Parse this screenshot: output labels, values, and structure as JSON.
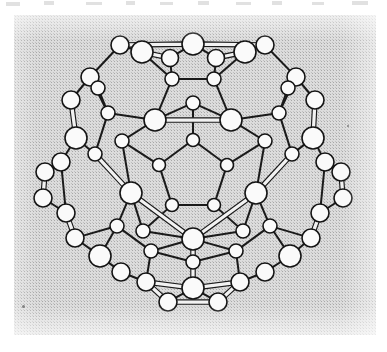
{
  "figure": {
    "caption": "",
    "alt_text": "Ball-and-stick structural model of the C60 buckminsterfullerene molecule viewed down a pseudo five-fold axis, drawn as open circles joined by double-line bonds on a grey halftone scanned background.",
    "rendering_style": "scanned halftone line drawing"
  },
  "colors": {
    "page_background": "#ffffff",
    "scan_background": "#dcdcdc",
    "halftone_dot": "#6e6e6e",
    "bond_stroke": "#1a1a1a",
    "bond_fill": "#f2f2f2",
    "atom_stroke": "#141414",
    "atom_fill": "#fafafa",
    "dust_speck": "#6a6a6a"
  },
  "scan_panel": {
    "x": 14,
    "y": 15,
    "width": 362,
    "height": 320
  },
  "scan_marks": [
    {
      "x": 6,
      "y": 2,
      "width": 14,
      "height": 4
    },
    {
      "x": 44,
      "y": 1,
      "width": 10,
      "height": 4
    },
    {
      "x": 86,
      "y": 2,
      "width": 16,
      "height": 3
    },
    {
      "x": 126,
      "y": 1,
      "width": 9,
      "height": 4
    },
    {
      "x": 160,
      "y": 2,
      "width": 13,
      "height": 3
    },
    {
      "x": 198,
      "y": 1,
      "width": 11,
      "height": 4
    },
    {
      "x": 236,
      "y": 2,
      "width": 15,
      "height": 3
    },
    {
      "x": 272,
      "y": 1,
      "width": 10,
      "height": 4
    },
    {
      "x": 312,
      "y": 2,
      "width": 12,
      "height": 3
    },
    {
      "x": 352,
      "y": 1,
      "width": 16,
      "height": 4
    }
  ],
  "dust_specks": [
    {
      "x": 22,
      "y": 305,
      "size": 3
    },
    {
      "x": 347,
      "y": 125,
      "size": 2
    }
  ],
  "molecule_data": {
    "type": "ball-and-stick",
    "formula": "C60",
    "name": "Buckminsterfullerene",
    "symmetry": "Ih",
    "atom_count": 60,
    "bond_count": 90,
    "face_counts": {
      "pentagons": 12,
      "hexagons": 20
    },
    "viewpoint": "down a pseudo five-fold axis",
    "atom_radii": {
      "front": 11,
      "middle": 8.5,
      "mid_back": 6.5,
      "back": 9
    },
    "atoms": [
      {
        "id": 0,
        "x": 193,
        "y": 140,
        "r": 6.5,
        "layer": "front-inner"
      },
      {
        "id": 1,
        "x": 159,
        "y": 165,
        "r": 6.5,
        "layer": "front-inner"
      },
      {
        "id": 2,
        "x": 172,
        "y": 205,
        "r": 6.5,
        "layer": "front-inner"
      },
      {
        "id": 3,
        "x": 214,
        "y": 205,
        "r": 6.5,
        "layer": "front-inner"
      },
      {
        "id": 4,
        "x": 227,
        "y": 165,
        "r": 6.5,
        "layer": "front-inner"
      },
      {
        "id": 5,
        "x": 193,
        "y": 103,
        "r": 7.0,
        "layer": "front-ring"
      },
      {
        "id": 6,
        "x": 122,
        "y": 141,
        "r": 7.0,
        "layer": "front-ring"
      },
      {
        "id": 7,
        "x": 143,
        "y": 231,
        "r": 7.0,
        "layer": "front-ring"
      },
      {
        "id": 8,
        "x": 243,
        "y": 231,
        "r": 7.0,
        "layer": "front-ring"
      },
      {
        "id": 9,
        "x": 265,
        "y": 141,
        "r": 7.0,
        "layer": "front-ring"
      },
      {
        "id": 10,
        "x": 155,
        "y": 120,
        "r": 11,
        "layer": "front-large"
      },
      {
        "id": 11,
        "x": 231,
        "y": 120,
        "r": 11,
        "layer": "front-large"
      },
      {
        "id": 12,
        "x": 256,
        "y": 193,
        "r": 11,
        "layer": "front-large"
      },
      {
        "id": 13,
        "x": 193,
        "y": 239,
        "r": 11,
        "layer": "front-large"
      },
      {
        "id": 14,
        "x": 131,
        "y": 193,
        "r": 11,
        "layer": "front-large"
      },
      {
        "id": 15,
        "x": 172,
        "y": 79,
        "r": 7.0,
        "layer": "mid-upper"
      },
      {
        "id": 16,
        "x": 214,
        "y": 79,
        "r": 7.0,
        "layer": "mid-upper"
      },
      {
        "id": 17,
        "x": 279,
        "y": 113,
        "r": 7.0,
        "layer": "mid-upper"
      },
      {
        "id": 18,
        "x": 292,
        "y": 154,
        "r": 7.0,
        "layer": "mid-upper"
      },
      {
        "id": 19,
        "x": 270,
        "y": 226,
        "r": 7.0,
        "layer": "mid-lower"
      },
      {
        "id": 20,
        "x": 236,
        "y": 251,
        "r": 7.0,
        "layer": "mid-lower"
      },
      {
        "id": 21,
        "x": 151,
        "y": 251,
        "r": 7.0,
        "layer": "mid-lower"
      },
      {
        "id": 22,
        "x": 117,
        "y": 226,
        "r": 7.0,
        "layer": "mid-lower"
      },
      {
        "id": 23,
        "x": 95,
        "y": 154,
        "r": 7.0,
        "layer": "mid-upper"
      },
      {
        "id": 24,
        "x": 108,
        "y": 113,
        "r": 7.0,
        "layer": "mid-upper"
      },
      {
        "id": 25,
        "x": 142,
        "y": 52,
        "r": 11,
        "layer": "equator-large"
      },
      {
        "id": 26,
        "x": 245,
        "y": 52,
        "r": 11,
        "layer": "equator-large"
      },
      {
        "id": 27,
        "x": 313,
        "y": 138,
        "r": 11,
        "layer": "equator-large"
      },
      {
        "id": 28,
        "x": 290,
        "y": 256,
        "r": 11,
        "layer": "equator-large"
      },
      {
        "id": 29,
        "x": 100,
        "y": 256,
        "r": 11,
        "layer": "equator-large"
      },
      {
        "id": 30,
        "x": 76,
        "y": 138,
        "r": 11,
        "layer": "equator-large"
      },
      {
        "id": 31,
        "x": 193,
        "y": 44,
        "r": 11,
        "layer": "top-rim"
      },
      {
        "id": 32,
        "x": 170,
        "y": 58,
        "r": 8.5,
        "layer": "top-rim"
      },
      {
        "id": 33,
        "x": 216,
        "y": 58,
        "r": 8.5,
        "layer": "top-rim"
      },
      {
        "id": 34,
        "x": 265,
        "y": 45,
        "r": 9,
        "layer": "top-rim"
      },
      {
        "id": 35,
        "x": 120,
        "y": 45,
        "r": 9,
        "layer": "top-rim"
      },
      {
        "id": 36,
        "x": 90,
        "y": 77,
        "r": 9,
        "layer": "silhouette"
      },
      {
        "id": 37,
        "x": 71,
        "y": 100,
        "r": 9,
        "layer": "silhouette"
      },
      {
        "id": 38,
        "x": 296,
        "y": 77,
        "r": 9,
        "layer": "silhouette"
      },
      {
        "id": 39,
        "x": 315,
        "y": 100,
        "r": 9,
        "layer": "silhouette"
      },
      {
        "id": 40,
        "x": 45,
        "y": 172,
        "r": 9,
        "layer": "silhouette"
      },
      {
        "id": 41,
        "x": 43,
        "y": 198,
        "r": 9,
        "layer": "silhouette"
      },
      {
        "id": 42,
        "x": 341,
        "y": 172,
        "r": 9,
        "layer": "silhouette"
      },
      {
        "id": 43,
        "x": 343,
        "y": 198,
        "r": 9,
        "layer": "silhouette"
      },
      {
        "id": 44,
        "x": 75,
        "y": 238,
        "r": 9,
        "layer": "silhouette"
      },
      {
        "id": 45,
        "x": 311,
        "y": 238,
        "r": 9,
        "layer": "silhouette"
      },
      {
        "id": 46,
        "x": 61,
        "y": 162,
        "r": 9,
        "layer": "back"
      },
      {
        "id": 47,
        "x": 325,
        "y": 162,
        "r": 9,
        "layer": "back"
      },
      {
        "id": 48,
        "x": 66,
        "y": 213,
        "r": 9,
        "layer": "back"
      },
      {
        "id": 49,
        "x": 320,
        "y": 213,
        "r": 9,
        "layer": "back"
      },
      {
        "id": 50,
        "x": 98,
        "y": 88,
        "r": 7.0,
        "layer": "back"
      },
      {
        "id": 51,
        "x": 288,
        "y": 88,
        "r": 7.0,
        "layer": "back"
      },
      {
        "id": 52,
        "x": 146,
        "y": 282,
        "r": 9,
        "layer": "bottom-rim"
      },
      {
        "id": 53,
        "x": 240,
        "y": 282,
        "r": 9,
        "layer": "bottom-rim"
      },
      {
        "id": 54,
        "x": 193,
        "y": 288,
        "r": 11,
        "layer": "bottom-rim"
      },
      {
        "id": 55,
        "x": 168,
        "y": 302,
        "r": 9,
        "layer": "bottom-rim"
      },
      {
        "id": 56,
        "x": 218,
        "y": 302,
        "r": 9,
        "layer": "bottom-rim"
      },
      {
        "id": 57,
        "x": 121,
        "y": 272,
        "r": 9,
        "layer": "bottom-rim"
      },
      {
        "id": 58,
        "x": 265,
        "y": 272,
        "r": 9,
        "layer": "bottom-rim"
      },
      {
        "id": 59,
        "x": 193,
        "y": 262,
        "r": 7.0,
        "layer": "bottom-rim"
      }
    ],
    "bonds": [
      {
        "a": 0,
        "b": 1,
        "style": "single"
      },
      {
        "a": 1,
        "b": 2,
        "style": "single"
      },
      {
        "a": 2,
        "b": 3,
        "style": "single"
      },
      {
        "a": 3,
        "b": 4,
        "style": "single"
      },
      {
        "a": 4,
        "b": 0,
        "style": "single"
      },
      {
        "a": 0,
        "b": 5,
        "style": "single"
      },
      {
        "a": 1,
        "b": 6,
        "style": "single"
      },
      {
        "a": 2,
        "b": 7,
        "style": "single"
      },
      {
        "a": 3,
        "b": 8,
        "style": "single"
      },
      {
        "a": 4,
        "b": 9,
        "style": "single"
      },
      {
        "a": 5,
        "b": 10,
        "style": "single"
      },
      {
        "a": 5,
        "b": 11,
        "style": "single"
      },
      {
        "a": 6,
        "b": 10,
        "style": "single"
      },
      {
        "a": 6,
        "b": 14,
        "style": "single"
      },
      {
        "a": 7,
        "b": 14,
        "style": "single"
      },
      {
        "a": 7,
        "b": 13,
        "style": "single"
      },
      {
        "a": 8,
        "b": 13,
        "style": "single"
      },
      {
        "a": 8,
        "b": 12,
        "style": "single"
      },
      {
        "a": 9,
        "b": 12,
        "style": "single"
      },
      {
        "a": 9,
        "b": 11,
        "style": "single"
      },
      {
        "a": 10,
        "b": 11,
        "style": "double"
      },
      {
        "a": 12,
        "b": 13,
        "style": "double"
      },
      {
        "a": 13,
        "b": 14,
        "style": "double"
      },
      {
        "a": 10,
        "b": 15,
        "style": "single"
      },
      {
        "a": 11,
        "b": 16,
        "style": "single"
      },
      {
        "a": 11,
        "b": 17,
        "style": "single"
      },
      {
        "a": 12,
        "b": 18,
        "style": "double"
      },
      {
        "a": 12,
        "b": 19,
        "style": "single"
      },
      {
        "a": 13,
        "b": 20,
        "style": "single"
      },
      {
        "a": 13,
        "b": 21,
        "style": "single"
      },
      {
        "a": 14,
        "b": 22,
        "style": "single"
      },
      {
        "a": 14,
        "b": 23,
        "style": "double"
      },
      {
        "a": 10,
        "b": 24,
        "style": "single"
      },
      {
        "a": 15,
        "b": 16,
        "style": "single"
      },
      {
        "a": 17,
        "b": 18,
        "style": "single"
      },
      {
        "a": 19,
        "b": 20,
        "style": "single"
      },
      {
        "a": 21,
        "b": 22,
        "style": "single"
      },
      {
        "a": 23,
        "b": 24,
        "style": "single"
      },
      {
        "a": 15,
        "b": 32,
        "style": "single"
      },
      {
        "a": 16,
        "b": 33,
        "style": "single"
      },
      {
        "a": 17,
        "b": 38,
        "style": "single"
      },
      {
        "a": 18,
        "b": 27,
        "style": "single"
      },
      {
        "a": 19,
        "b": 45,
        "style": "single"
      },
      {
        "a": 20,
        "b": 53,
        "style": "single"
      },
      {
        "a": 21,
        "b": 52,
        "style": "single"
      },
      {
        "a": 22,
        "b": 44,
        "style": "single"
      },
      {
        "a": 23,
        "b": 30,
        "style": "single"
      },
      {
        "a": 24,
        "b": 36,
        "style": "single"
      },
      {
        "a": 31,
        "b": 32,
        "style": "single"
      },
      {
        "a": 31,
        "b": 33,
        "style": "single"
      },
      {
        "a": 32,
        "b": 25,
        "style": "double"
      },
      {
        "a": 33,
        "b": 26,
        "style": "double"
      },
      {
        "a": 31,
        "b": 34,
        "style": "double"
      },
      {
        "a": 31,
        "b": 35,
        "style": "double"
      },
      {
        "a": 25,
        "b": 35,
        "style": "single"
      },
      {
        "a": 26,
        "b": 34,
        "style": "single"
      },
      {
        "a": 25,
        "b": 15,
        "style": "single"
      },
      {
        "a": 26,
        "b": 16,
        "style": "single"
      },
      {
        "a": 35,
        "b": 36,
        "style": "single"
      },
      {
        "a": 34,
        "b": 38,
        "style": "single"
      },
      {
        "a": 36,
        "b": 37,
        "style": "single"
      },
      {
        "a": 38,
        "b": 39,
        "style": "single"
      },
      {
        "a": 36,
        "b": 50,
        "style": "single"
      },
      {
        "a": 38,
        "b": 51,
        "style": "single"
      },
      {
        "a": 37,
        "b": 30,
        "style": "double"
      },
      {
        "a": 39,
        "b": 27,
        "style": "double"
      },
      {
        "a": 30,
        "b": 46,
        "style": "single"
      },
      {
        "a": 27,
        "b": 47,
        "style": "single"
      },
      {
        "a": 46,
        "b": 40,
        "style": "single"
      },
      {
        "a": 47,
        "b": 42,
        "style": "single"
      },
      {
        "a": 40,
        "b": 41,
        "style": "double"
      },
      {
        "a": 42,
        "b": 43,
        "style": "double"
      },
      {
        "a": 41,
        "b": 48,
        "style": "single"
      },
      {
        "a": 43,
        "b": 49,
        "style": "single"
      },
      {
        "a": 48,
        "b": 44,
        "style": "double"
      },
      {
        "a": 49,
        "b": 45,
        "style": "double"
      },
      {
        "a": 44,
        "b": 29,
        "style": "single"
      },
      {
        "a": 45,
        "b": 28,
        "style": "single"
      },
      {
        "a": 29,
        "b": 57,
        "style": "single"
      },
      {
        "a": 28,
        "b": 58,
        "style": "single"
      },
      {
        "a": 29,
        "b": 22,
        "style": "single"
      },
      {
        "a": 28,
        "b": 19,
        "style": "single"
      },
      {
        "a": 57,
        "b": 52,
        "style": "single"
      },
      {
        "a": 58,
        "b": 53,
        "style": "single"
      },
      {
        "a": 52,
        "b": 55,
        "style": "double"
      },
      {
        "a": 53,
        "b": 56,
        "style": "double"
      },
      {
        "a": 55,
        "b": 56,
        "style": "double"
      },
      {
        "a": 54,
        "b": 55,
        "style": "single"
      },
      {
        "a": 54,
        "b": 56,
        "style": "single"
      },
      {
        "a": 54,
        "b": 52,
        "style": "double"
      },
      {
        "a": 54,
        "b": 53,
        "style": "double"
      },
      {
        "a": 54,
        "b": 59,
        "style": "double"
      },
      {
        "a": 59,
        "b": 13,
        "style": "double"
      },
      {
        "a": 59,
        "b": 20,
        "style": "single"
      },
      {
        "a": 59,
        "b": 21,
        "style": "single"
      },
      {
        "a": 50,
        "b": 24,
        "style": "single"
      },
      {
        "a": 51,
        "b": 17,
        "style": "single"
      },
      {
        "a": 46,
        "b": 48,
        "style": "single"
      },
      {
        "a": 47,
        "b": 49,
        "style": "single"
      }
    ]
  }
}
